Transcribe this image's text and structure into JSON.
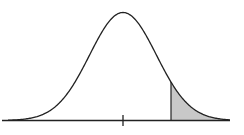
{
  "diagram": {
    "type": "normal-distribution-curve",
    "curve": {
      "mean_x": 123,
      "sigma_px": 33.4,
      "peak_height_px": 108,
      "baseline_y": 120.5,
      "x_start": 8,
      "x_end": 230,
      "stroke": "#222222"
    },
    "baseline": {
      "x1": 2,
      "x2": 230,
      "y": 120.5,
      "stroke": "#222222"
    },
    "center_tick": {
      "x": 123,
      "y1": 115,
      "y2": 126
    },
    "shaded_region": {
      "x_start": 171,
      "x_end": 228,
      "fill": "#c8c8c8",
      "stroke": "#222222"
    }
  }
}
